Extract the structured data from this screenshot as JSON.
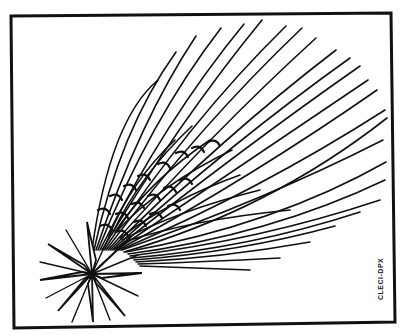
{
  "illustration": {
    "subject": "comet",
    "style": "black-and-white line art",
    "credit": "CLECI-DPX",
    "colors": {
      "ink": "#111111",
      "paper": "#ffffff"
    }
  }
}
